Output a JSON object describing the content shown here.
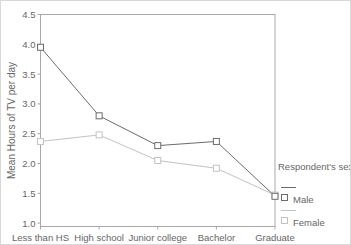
{
  "chart_data": {
    "type": "line",
    "title": "",
    "xlabel": "",
    "ylabel": "Mean Hours of TV per day",
    "categories": [
      "Less than HS",
      "High school",
      "Junior college",
      "Bachelor",
      "Graduate"
    ],
    "series": [
      {
        "name": "Male",
        "color": "#6b6b6b",
        "values": [
          3.95,
          2.8,
          2.3,
          2.37,
          1.45
        ]
      },
      {
        "name": "Female",
        "color": "#c3c3c3",
        "values": [
          2.37,
          2.48,
          2.05,
          1.92,
          1.47
        ]
      }
    ],
    "ylim": [
      1.0,
      4.5
    ],
    "yticks": [
      4.5,
      4.0,
      3.5,
      3.0,
      2.5,
      2.0,
      1.5,
      1.0
    ],
    "grid": false,
    "marker": "open-square",
    "legend_title": "Respondent's sex",
    "legend_position": "right-bottom",
    "axis_color": "#a8a8a8",
    "text_color": "#666666"
  }
}
